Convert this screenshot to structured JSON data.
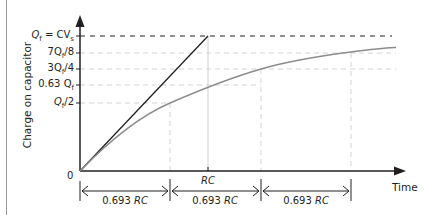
{
  "diagram": {
    "y_axis_label": "Charge on capacitor",
    "x_axis_label": "Time",
    "origin_label": "0",
    "y_ticks": [
      {
        "prefix": "Q",
        "sub": "f",
        "suffix": " = CV",
        "sub2": "s",
        "text": "Qf = CVs",
        "fraction": 1.0
      },
      {
        "prefix": "7Q",
        "sub": "f",
        "suffix": "/8",
        "text": "7Qf/8",
        "fraction": 0.875
      },
      {
        "prefix": "3Q",
        "sub": "f",
        "suffix": "/4",
        "text": "3Qf/4",
        "fraction": 0.75
      },
      {
        "prefix": "0.63 Q",
        "sub": "f",
        "suffix": "",
        "text": "0.63 Qf",
        "fraction": 0.63
      },
      {
        "prefix": "Q",
        "sub": "f",
        "suffix": "/2",
        "text": "Qf/2",
        "fraction": 0.5
      }
    ],
    "x_markers": [
      {
        "label": "RC",
        "position": "1 time constant"
      }
    ],
    "intervals": [
      {
        "num": "0.693 ",
        "unit": "RC",
        "text": "0.693 RC"
      },
      {
        "num": "0.693 ",
        "unit": "RC",
        "text": "0.693 RC"
      },
      {
        "num": "0.693 ",
        "unit": "RC",
        "text": "0.693 RC"
      }
    ],
    "rc_label": "RC",
    "series": [
      {
        "name": "initial tangent (linear)",
        "color": "#231f20"
      },
      {
        "name": "exponential charge curve",
        "color": "#8c8c8c"
      }
    ],
    "colors": {
      "axis": "#231f20",
      "curve": "#8c8c8c",
      "guide_dash": "#cfcfcf",
      "qf_dash": "#231f20"
    }
  }
}
